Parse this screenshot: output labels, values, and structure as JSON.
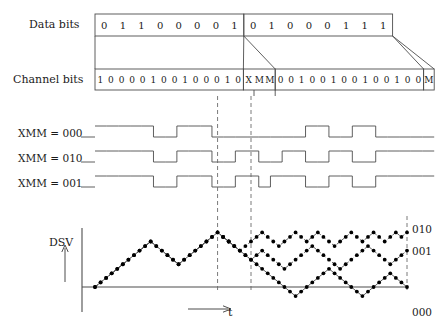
{
  "figure": {
    "rows": {
      "data_bits_label": "Data bits",
      "channel_bits_label": "Channel bits",
      "dsv_label": "DSV",
      "time_axis_label": "t"
    },
    "data_bits": {
      "frame1": [
        "0",
        "1",
        "1",
        "0",
        "0",
        "0",
        "0",
        "1"
      ],
      "frame2": [
        "0",
        "1",
        "0",
        "0",
        "0",
        "1",
        "1",
        "1"
      ]
    },
    "channel_bits": {
      "frame1": [
        "1",
        "0",
        "0",
        "0",
        "0",
        "1",
        "0",
        "0",
        "1",
        "0",
        "0",
        "0",
        "1",
        "0"
      ],
      "merging1": [
        "X",
        "M",
        "M"
      ],
      "frame2": [
        "0",
        "0",
        "1",
        "0",
        "0",
        "1",
        "0",
        "0",
        "1",
        "0",
        "0",
        "1",
        "0",
        "0"
      ],
      "merging2": [
        "M"
      ]
    },
    "waveforms": [
      {
        "name": "XMM = 000",
        "label": "XMM = 000",
        "levels": [
          1,
          1,
          1,
          1,
          1,
          0,
          0,
          1,
          1,
          1,
          0,
          0,
          0,
          0,
          0,
          0,
          0,
          0,
          1,
          1,
          0,
          0,
          1,
          1,
          0,
          0,
          0,
          0,
          0
        ]
      },
      {
        "name": "XMM = 010",
        "label": "XMM = 010",
        "levels": [
          1,
          1,
          1,
          1,
          1,
          0,
          0,
          1,
          1,
          1,
          0,
          0,
          1,
          1,
          0,
          0,
          1,
          1,
          0,
          0,
          1,
          1,
          0,
          0,
          1,
          1,
          1,
          1,
          1
        ]
      },
      {
        "name": "XMM = 001",
        "label": "XMM = 001",
        "levels": [
          1,
          1,
          1,
          1,
          1,
          0,
          0,
          1,
          1,
          1,
          0,
          0,
          1,
          1,
          0,
          1,
          1,
          1,
          0,
          0,
          1,
          1,
          0,
          0,
          1,
          1,
          1,
          1,
          1
        ]
      }
    ],
    "dsv_curve_labels": {
      "top": "010",
      "middle": "001",
      "bottom": "000"
    },
    "colors": {
      "stroke": "#4d4d4d",
      "text": "#1a1a1a",
      "dash": "#6b6b6b",
      "marker": "#000000"
    }
  },
  "chart_data": {
    "type": "line",
    "title": "DSV",
    "xlabel": "t",
    "ylabel": "DSV",
    "grid": false,
    "legend_position": "right",
    "axis_ranges": {
      "x": [
        0,
        56
      ],
      "y": [
        -4,
        16
      ]
    },
    "annotations": [
      "010",
      "001",
      "000"
    ],
    "series": [
      {
        "name": "000",
        "values": [
          0,
          1,
          2,
          3,
          4,
          5,
          6,
          7,
          8,
          9,
          10,
          9,
          8,
          7,
          6,
          5,
          6,
          7,
          8,
          9,
          10,
          11,
          12,
          11,
          10,
          9,
          8,
          7,
          6,
          5,
          4,
          3,
          2,
          1,
          0,
          -1,
          -2,
          -1,
          0,
          1,
          2,
          3,
          4,
          3,
          2,
          1,
          0,
          -1,
          -2,
          -1,
          0,
          1,
          2,
          3,
          2,
          1,
          0
        ]
      },
      {
        "name": "001",
        "values": [
          0,
          1,
          2,
          3,
          4,
          5,
          6,
          7,
          8,
          9,
          10,
          9,
          8,
          7,
          6,
          5,
          6,
          7,
          8,
          9,
          10,
          11,
          12,
          11,
          10,
          9,
          8,
          7,
          6,
          7,
          8,
          7,
          6,
          5,
          4,
          5,
          6,
          7,
          8,
          9,
          8,
          7,
          6,
          5,
          4,
          5,
          6,
          7,
          8,
          9,
          8,
          7,
          6,
          5,
          6,
          7,
          8
        ]
      },
      {
        "name": "010",
        "values": [
          0,
          1,
          2,
          3,
          4,
          5,
          6,
          7,
          8,
          9,
          10,
          9,
          8,
          7,
          6,
          5,
          6,
          7,
          8,
          9,
          10,
          11,
          12,
          11,
          10,
          9,
          8,
          9,
          10,
          11,
          12,
          11,
          10,
          9,
          10,
          11,
          12,
          11,
          10,
          11,
          12,
          11,
          10,
          9,
          10,
          11,
          12,
          11,
          10,
          11,
          12,
          11,
          10,
          11,
          12,
          11,
          12
        ]
      }
    ]
  }
}
